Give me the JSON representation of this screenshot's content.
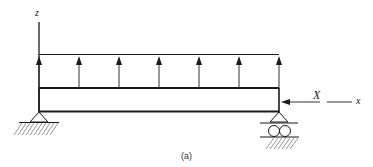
{
  "diagram": {
    "type": "beam-loading-diagram",
    "caption": "(a)",
    "axes": {
      "vertical_label": "z",
      "horizontal_label": "x"
    },
    "axial_force": {
      "label": "X",
      "direction": "left"
    },
    "distributed_load": {
      "direction": "up",
      "arrow_count": 7,
      "arrow_x": [
        39,
        79,
        119,
        159,
        199,
        239,
        279
      ]
    },
    "beam": {
      "x1": 39,
      "x2": 279,
      "y_top": 88,
      "y_bottom": 111
    },
    "supports": [
      {
        "type": "pin",
        "position": "left",
        "x": 39
      },
      {
        "type": "roller",
        "position": "right",
        "x": 279
      }
    ],
    "colors": {
      "line": "#1a1a1a",
      "hatch": "#555555",
      "background": "#ffffff"
    }
  }
}
